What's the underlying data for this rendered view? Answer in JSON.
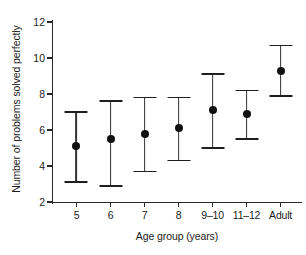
{
  "chart_data": {
    "type": "scatter",
    "title": "",
    "xlabel": "Age group (years)",
    "ylabel": "Number of problems solved perfectly",
    "categories": [
      "5",
      "6",
      "7",
      "8",
      "9–10",
      "11–12",
      "Adult"
    ],
    "values": [
      5.1,
      5.5,
      5.8,
      6.1,
      7.1,
      6.9,
      9.3
    ],
    "error_low": [
      3.1,
      2.9,
      3.7,
      4.3,
      5.0,
      5.5,
      7.9
    ],
    "error_high": [
      7.0,
      7.6,
      7.8,
      7.8,
      9.1,
      8.2,
      10.7
    ],
    "ylim": [
      2,
      12
    ],
    "yticks": [
      2,
      4,
      6,
      8,
      10,
      12
    ],
    "ytick_labels": [
      "2",
      "4",
      "6",
      "8",
      "10",
      "12"
    ],
    "grid": false,
    "legend": "none",
    "marker": "filled-circle",
    "errorbar_style": "capped-vertical"
  },
  "axes": {
    "y_label": "Number of problems solved perfectly",
    "x_label": "Age group (years)"
  },
  "colors": {
    "marker": "#111111",
    "errorbar": "#333333",
    "axis": "#2a2a2a",
    "background": "#ffffff",
    "text": "#1b1b1b"
  }
}
